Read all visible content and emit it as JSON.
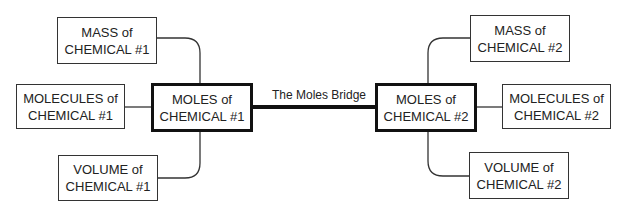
{
  "diagram": {
    "bridge_label": "The Moles Bridge",
    "left": {
      "center": {
        "line1": "MOLES of",
        "line2": "CHEMICAL #1"
      },
      "mass": {
        "line1": "MASS of",
        "line2": "CHEMICAL #1"
      },
      "molecules": {
        "line1": "MOLECULES of",
        "line2": "CHEMICAL #1"
      },
      "volume": {
        "line1": "VOLUME of",
        "line2": "CHEMICAL #1"
      }
    },
    "right": {
      "center": {
        "line1": "MOLES of",
        "line2": "CHEMICAL #2"
      },
      "mass": {
        "line1": "MASS of",
        "line2": "CHEMICAL #2"
      },
      "molecules": {
        "line1": "MOLECULES of",
        "line2": "CHEMICAL #2"
      },
      "volume": {
        "line1": "VOLUME of",
        "line2": "CHEMICAL #2"
      }
    }
  }
}
